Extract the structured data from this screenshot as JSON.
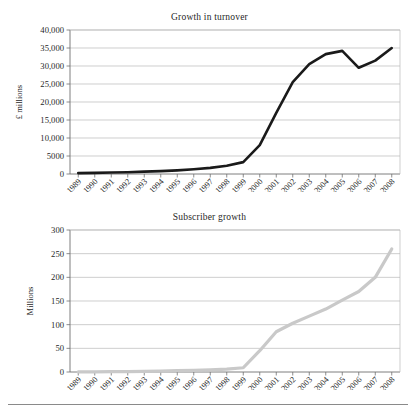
{
  "page": {
    "background": "#ffffff",
    "bottom_rule": true
  },
  "chart_data": [
    {
      "id": "turnover",
      "type": "line",
      "title": "Growth in turnover",
      "xlabel": "",
      "ylabel": "£ millions",
      "categories": [
        "1989",
        "1990",
        "1991",
        "1992",
        "1993",
        "1994",
        "1995",
        "1996",
        "1997",
        "1998",
        "1999",
        "2000",
        "2001",
        "2002",
        "2003",
        "2004",
        "2005",
        "2006",
        "2007",
        "2008"
      ],
      "values": [
        250,
        300,
        400,
        500,
        650,
        800,
        1000,
        1300,
        1700,
        2300,
        3300,
        8000,
        17000,
        25500,
        30500,
        33300,
        34200,
        29500,
        31500,
        35000
      ],
      "ytick_labels": [
        "0",
        "5000",
        "10,000",
        "15,000",
        "20,000",
        "25,000",
        "30,000",
        "35,000",
        "40,000"
      ],
      "ytick_values": [
        0,
        5000,
        10000,
        15000,
        20000,
        25000,
        30000,
        35000,
        40000
      ],
      "ylim": [
        0,
        40000
      ],
      "grid": true,
      "legend": "none",
      "series_color": "#1a1a1a",
      "line_width": 2.6
    },
    {
      "id": "subscribers",
      "type": "line",
      "title": "Subscriber growth",
      "xlabel": "",
      "ylabel": "Millions",
      "categories": [
        "1989",
        "1990",
        "1991",
        "1992",
        "1993",
        "1994",
        "1995",
        "1996",
        "1997",
        "1998",
        "1999",
        "2000",
        "2001",
        "2002",
        "2003",
        "2004",
        "2005",
        "2006",
        "2007",
        "2008"
      ],
      "values": [
        0.2,
        0.4,
        0.7,
        1.0,
        1.5,
        2.0,
        2.8,
        3.5,
        4.5,
        6.0,
        9.0,
        45,
        85,
        103,
        118,
        133,
        152,
        170,
        200,
        260
      ],
      "ytick_labels": [
        "0",
        "50",
        "100",
        "150",
        "200",
        "250",
        "300"
      ],
      "ytick_values": [
        0,
        50,
        100,
        150,
        200,
        250,
        300
      ],
      "ylim": [
        0,
        300
      ],
      "grid": true,
      "legend": "none",
      "series_color": "#c9c9c9",
      "line_width": 3.2
    }
  ]
}
